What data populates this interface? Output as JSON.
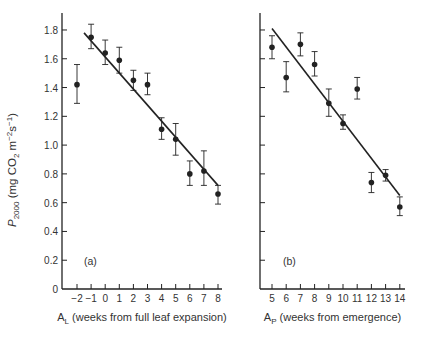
{
  "chart_data": [
    {
      "type": "scatter",
      "panel_label": "(a)",
      "title": "",
      "xlabel": "A_L (weeks from full leaf expansion)",
      "xlabel_main": "A",
      "xlabel_sub": "L",
      "xlabel_rest": " (weeks from full leaf expansion)",
      "ylabel": "P_2000 (mg CO2 m^-2 s^-1)",
      "ylim": [
        0,
        1.8
      ],
      "y_ticks": [
        0,
        0.2,
        0.4,
        0.6,
        0.8,
        1.0,
        1.2,
        1.4,
        1.6,
        1.8
      ],
      "y_tick_labels": [
        "0",
        "0.2",
        "0.4",
        "0.6",
        "0.8",
        "1.0",
        "1.2",
        "1.4",
        "1.6",
        "1.8"
      ],
      "x_ticks": [
        -2,
        -1,
        0,
        1,
        2,
        3,
        4,
        5,
        6,
        7,
        8
      ],
      "x_tick_labels": [
        "−2",
        "−1",
        "0",
        "1",
        "2",
        "3",
        "4",
        "5",
        "6",
        "7",
        "8"
      ],
      "x": [
        -2,
        -1,
        0,
        1,
        2,
        3,
        4,
        5,
        6,
        7,
        8
      ],
      "y": [
        1.42,
        1.75,
        1.64,
        1.59,
        1.45,
        1.42,
        1.11,
        1.04,
        0.8,
        0.82,
        0.66
      ],
      "err_low": [
        1.29,
        1.67,
        1.56,
        1.5,
        1.38,
        1.35,
        1.04,
        0.93,
        0.72,
        0.72,
        0.59
      ],
      "err_high": [
        1.56,
        1.84,
        1.73,
        1.68,
        1.52,
        1.5,
        1.19,
        1.15,
        0.89,
        0.96,
        0.72
      ],
      "fit_line": {
        "x": [
          -1.5,
          8
        ],
        "y": [
          1.78,
          0.72
        ]
      },
      "grid": false
    },
    {
      "type": "scatter",
      "panel_label": "(b)",
      "title": "",
      "xlabel": "A_P (weeks from emergence)",
      "xlabel_main": "A",
      "xlabel_sub": "P",
      "xlabel_rest": " (weeks from emergence)",
      "ylabel": "",
      "ylim": [
        0,
        1.8
      ],
      "y_ticks": [
        0,
        0.2,
        0.4,
        0.6,
        0.8,
        1.0,
        1.2,
        1.4,
        1.6,
        1.8
      ],
      "x_ticks": [
        5,
        6,
        7,
        8,
        9,
        10,
        11,
        12,
        13,
        14
      ],
      "x_tick_labels": [
        "5",
        "6",
        "7",
        "8",
        "9",
        "10",
        "11",
        "12",
        "13",
        "14"
      ],
      "x": [
        5,
        6,
        7,
        8,
        9,
        10,
        11,
        12,
        13,
        14
      ],
      "y": [
        1.68,
        1.47,
        1.7,
        1.56,
        1.29,
        1.15,
        1.39,
        0.74,
        0.79,
        0.57
      ],
      "err_low": [
        1.6,
        1.37,
        1.62,
        1.48,
        1.2,
        1.11,
        1.32,
        0.67,
        0.75,
        0.51
      ],
      "err_high": [
        1.76,
        1.58,
        1.78,
        1.65,
        1.39,
        1.21,
        1.47,
        0.81,
        0.83,
        0.64
      ],
      "fit_line": {
        "x": [
          5,
          14
        ],
        "y": [
          1.81,
          0.65
        ]
      },
      "grid": false
    }
  ],
  "ylabel_parts": {
    "p": "P",
    "sub": "2000",
    "rest1": " (mg CO",
    "co2sub": "2",
    "rest2": " m",
    "sup1": "−2",
    "rest3": "s",
    "sup2": "−1",
    "rest4": ")"
  },
  "layout": {
    "panels": [
      {
        "axis_x": 62,
        "x0_px": 77,
        "x0_val": -2,
        "px_per_unit": 14.1,
        "x_end": 222,
        "y0_px": 289,
        "px_per_val": 143.9,
        "y_top": 13,
        "label_pos": [
          84,
          265
        ]
      },
      {
        "axis_x": 260,
        "x0_px": 272,
        "x0_val": 5,
        "px_per_unit": 14.2,
        "x_end": 405,
        "y0_px": 289,
        "px_per_val": 143.9,
        "y_top": 13,
        "label_pos": [
          283,
          265
        ]
      }
    ],
    "ink": "#222222"
  }
}
